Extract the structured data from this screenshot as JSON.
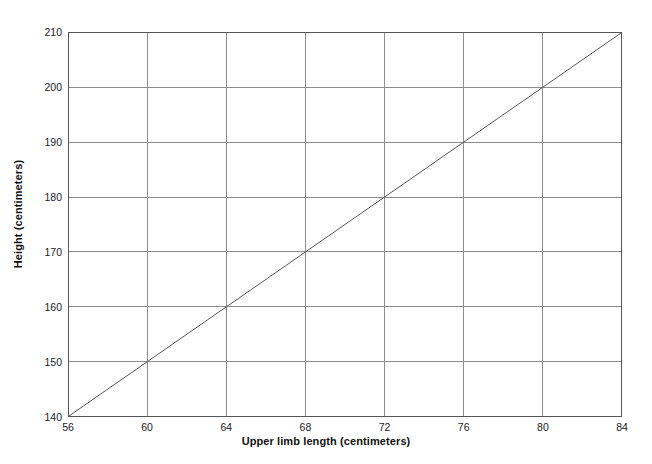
{
  "chart_data": {
    "type": "line",
    "title": "",
    "xlabel": "Upper limb length (centimeters)",
    "ylabel": "Height (centimeters)",
    "xlim": [
      56,
      84
    ],
    "ylim": [
      140,
      210
    ],
    "xticks": [
      56,
      60,
      64,
      68,
      72,
      76,
      80,
      84
    ],
    "yticks": [
      140,
      150,
      160,
      170,
      180,
      190,
      200,
      210
    ],
    "xtick_labels": [
      "56",
      "60",
      "64",
      "68",
      "72",
      "76",
      "80",
      "84"
    ],
    "ytick_labels": [
      "140",
      "150",
      "160",
      "170",
      "180",
      "190",
      "200",
      "210"
    ],
    "grid": true,
    "legend": "none",
    "series": [
      {
        "name": "height-vs-upper-limb-length",
        "x": [
          56,
          60,
          64,
          68,
          72,
          76,
          80,
          84
        ],
        "values": [
          140,
          150,
          160,
          170,
          180,
          190,
          200,
          210
        ],
        "color": "#555555",
        "line_width": 1
      }
    ],
    "colors": {
      "line": "#555555",
      "grid": "#8c8c8c",
      "axis": "#555555",
      "background": "#ffffff",
      "text": "#111111"
    }
  }
}
